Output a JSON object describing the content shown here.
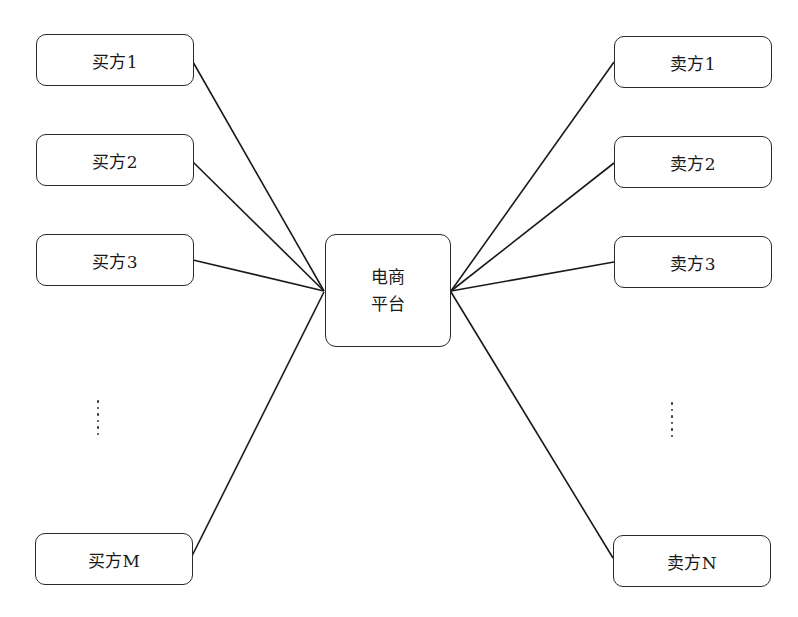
{
  "diagram": {
    "type": "hub-and-spoke",
    "center": {
      "id": "platform",
      "lines": [
        "电商",
        "平台"
      ]
    },
    "buyers": [
      {
        "id": "buyer-1",
        "label": "买方1"
      },
      {
        "id": "buyer-2",
        "label": "买方2"
      },
      {
        "id": "buyer-3",
        "label": "买方3"
      },
      {
        "id": "buyer-m",
        "label": "买方M"
      }
    ],
    "sellers": [
      {
        "id": "seller-1",
        "label": "卖方1"
      },
      {
        "id": "seller-2",
        "label": "卖方2"
      },
      {
        "id": "seller-3",
        "label": "卖方3"
      },
      {
        "id": "seller-n",
        "label": "卖方N"
      }
    ],
    "ellipsis": "……",
    "edges": [
      {
        "from": "buyer-1",
        "to": "platform"
      },
      {
        "from": "buyer-2",
        "to": "platform"
      },
      {
        "from": "buyer-3",
        "to": "platform"
      },
      {
        "from": "buyer-m",
        "to": "platform"
      },
      {
        "from": "platform",
        "to": "seller-1"
      },
      {
        "from": "platform",
        "to": "seller-2"
      },
      {
        "from": "platform",
        "to": "seller-3"
      },
      {
        "from": "platform",
        "to": "seller-n"
      }
    ],
    "colors": {
      "stroke": "#1a1a1a",
      "background": "#ffffff"
    }
  }
}
